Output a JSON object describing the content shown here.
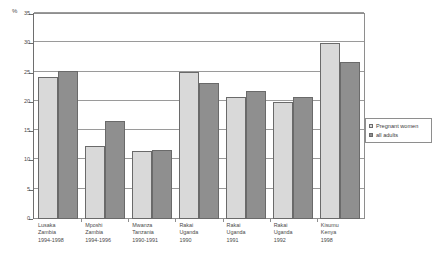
{
  "chart_data": {
    "type": "bar",
    "title": "",
    "subtitle": "",
    "xlabel": "",
    "ylabel": "%",
    "ylim": [
      0,
      35
    ],
    "ytick_step": 5,
    "yticks": [
      "0",
      "5",
      "10",
      "15",
      "20",
      "25",
      "30",
      "35"
    ],
    "grid": true,
    "legend_position": "right",
    "categories": [
      "Lusaka\nZambia\n1994-1998",
      "Mposhi\nZambia\n1994-1996",
      "Mwanza\nTanzania\n1990-1991",
      "Rakai\nUganda\n1990",
      "Rakai\nUganda\n1991",
      "Rakai\nUganda\n1992",
      "Kisumu\nKenya\n1998"
    ],
    "category_lines": [
      [
        "Lusaka",
        "Zambia",
        "1994-1998"
      ],
      [
        "Mposhi",
        "Zambia",
        "1994-1996"
      ],
      [
        "Mwanza",
        "Tanzania",
        "1990-1991"
      ],
      [
        "Rakai",
        "Uganda",
        "1990"
      ],
      [
        "Rakai",
        "Uganda",
        "1991"
      ],
      [
        "Rakai",
        "Uganda",
        "1992"
      ],
      [
        "Kisumu",
        "Kenya",
        "1998"
      ]
    ],
    "series": [
      {
        "name": "Pregnant women",
        "color": "#d9d9d9",
        "values": [
          24.3,
          12.5,
          11.6,
          25.1,
          20.9,
          20.0,
          30.0
        ]
      },
      {
        "name": "all adults",
        "color": "#8f8f8f",
        "values": [
          25.3,
          16.7,
          11.8,
          23.2,
          21.8,
          20.8,
          26.8
        ]
      }
    ]
  },
  "legend": {
    "items": [
      {
        "label": "Pregnant women",
        "color": "#d9d9d9"
      },
      {
        "label": "all adults",
        "color": "#8f8f8f"
      }
    ]
  },
  "axis": {
    "y_unit": "%"
  }
}
